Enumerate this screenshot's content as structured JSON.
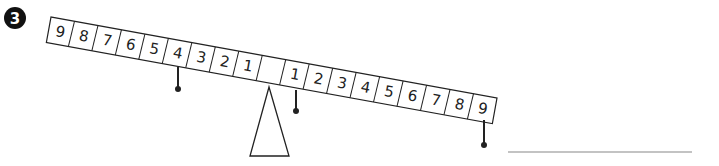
{
  "question": {
    "number": "3",
    "badge_color": "#111111"
  },
  "beam": {
    "left_labels": [
      "9",
      "8",
      "7",
      "6",
      "5",
      "4",
      "3",
      "2",
      "1"
    ],
    "center_label": "",
    "right_labels": [
      "1",
      "2",
      "3",
      "4",
      "5",
      "6",
      "7",
      "8",
      "9"
    ],
    "line_color": "#222222"
  },
  "weights": [
    {
      "side": "left",
      "position": "4"
    },
    {
      "side": "right",
      "position": "1"
    },
    {
      "side": "right",
      "position": "9"
    }
  ],
  "fulcrum": {
    "shape": "triangle"
  },
  "answer": {
    "value": "",
    "line_color": "#888888"
  }
}
